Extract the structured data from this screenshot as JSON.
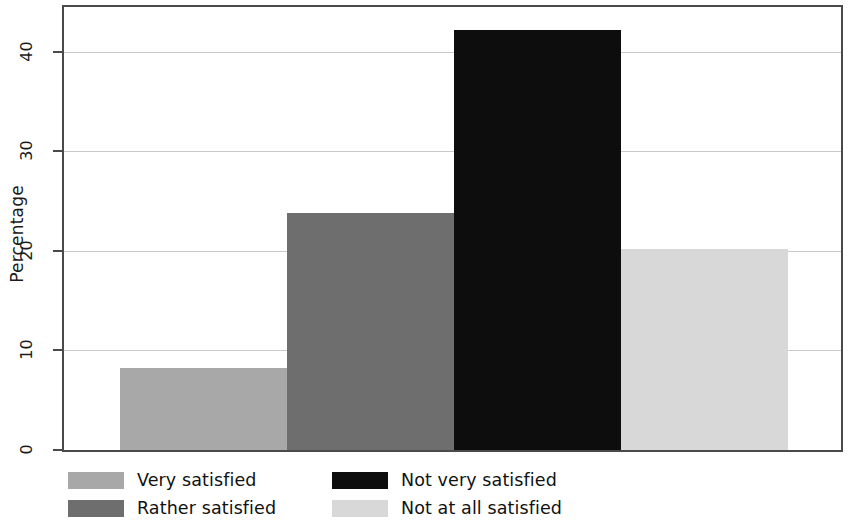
{
  "chart_data": {
    "type": "bar",
    "title": "",
    "subtitle": "",
    "xlabel": "",
    "ylabel": "Percentage",
    "ylim": [
      0,
      44.5
    ],
    "yticks": [
      0,
      10,
      20,
      30,
      40
    ],
    "ytick_labels": [
      "0",
      "10",
      "20",
      "30",
      "40"
    ],
    "grid": true,
    "grid_axis": "y",
    "legend_position": "bottom",
    "legend_columns": 2,
    "categories": [
      "Very satisfied",
      "Rather satisfied",
      "Not very satisfied",
      "Not at all satisfied"
    ],
    "values": [
      8.2,
      23.8,
      42.2,
      20.2
    ],
    "bar_colors": [
      "#a8a8a8",
      "#6e6e6e",
      "#0d0d0d",
      "#d8d8d8"
    ],
    "series": [
      {
        "name": "Percentage",
        "values": [
          8.2,
          23.8,
          42.2,
          20.2
        ]
      }
    ]
  },
  "axes": {
    "y_title": "Percentage",
    "ticks": [
      {
        "label": "40",
        "value": 40
      },
      {
        "label": "30",
        "value": 30
      },
      {
        "label": "20",
        "value": 20
      },
      {
        "label": "10",
        "value": 10
      },
      {
        "label": "0",
        "value": 0
      }
    ]
  },
  "bars": [
    {
      "label": "Very satisfied",
      "value": 8.2,
      "color": "#a8a8a8"
    },
    {
      "label": "Rather satisfied",
      "value": 23.8,
      "color": "#6e6e6e"
    },
    {
      "label": "Not very satisfied",
      "value": 42.2,
      "color": "#0d0d0d"
    },
    {
      "label": "Not at all satisfied",
      "value": 20.2,
      "color": "#d8d8d8"
    }
  ],
  "legend": {
    "items": [
      {
        "label": "Very satisfied",
        "color": "#a8a8a8"
      },
      {
        "label": "Rather satisfied",
        "color": "#6e6e6e"
      },
      {
        "label": "Not very satisfied",
        "color": "#0d0d0d"
      },
      {
        "label": "Not at all satisfied",
        "color": "#d8d8d8"
      }
    ]
  }
}
